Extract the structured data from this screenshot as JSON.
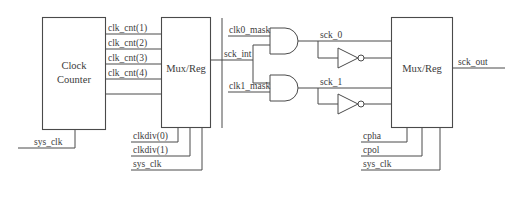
{
  "diagram": {
    "background_color": "#ffffff",
    "line_color": "#4a4a4a",
    "blocks": [
      {
        "id": "clock_counter",
        "line1": "Clock",
        "line2": "Counter"
      },
      {
        "id": "mux_reg_left",
        "line1": "Mux/Reg",
        "line2": ""
      },
      {
        "id": "mux_reg_right",
        "line1": "Mux/Reg",
        "line2": ""
      }
    ],
    "signals": {
      "clk_cnt_1": "clk_cnt(1)",
      "clk_cnt_2": "clk_cnt(2)",
      "clk_cnt_3": "clk_cnt(3)",
      "clk_cnt_4": "clk_cnt(4)",
      "sys_clk_left": "sys_clk",
      "clkdiv_0": "clkdiv(0)",
      "clkdiv_1": "clkdiv(1)",
      "sys_clk_mid": "sys_clk",
      "clk0_mask": "clk0_mask",
      "clk1_mask": "clk1_mask",
      "sck_int": "sck_int",
      "sck_0": "sck_0",
      "sck_1": "sck_1",
      "cpha": "cpha",
      "cpol": "cpol",
      "sys_clk_right": "sys_clk",
      "sck_out": "sck_out"
    },
    "gates": [
      {
        "id": "and_gate_0",
        "type": "AND",
        "inputs": [
          "clk0_mask",
          "sck_int"
        ],
        "output": "sck_0"
      },
      {
        "id": "and_gate_1",
        "type": "AND",
        "inputs": [
          "clk1_mask",
          "sck_int"
        ],
        "output": "sck_1"
      },
      {
        "id": "inverter_0",
        "type": "NOT",
        "inputs": [
          "sck_0"
        ],
        "output": ""
      },
      {
        "id": "inverter_1",
        "type": "NOT",
        "inputs": [
          "sck_1"
        ],
        "output": ""
      }
    ]
  }
}
